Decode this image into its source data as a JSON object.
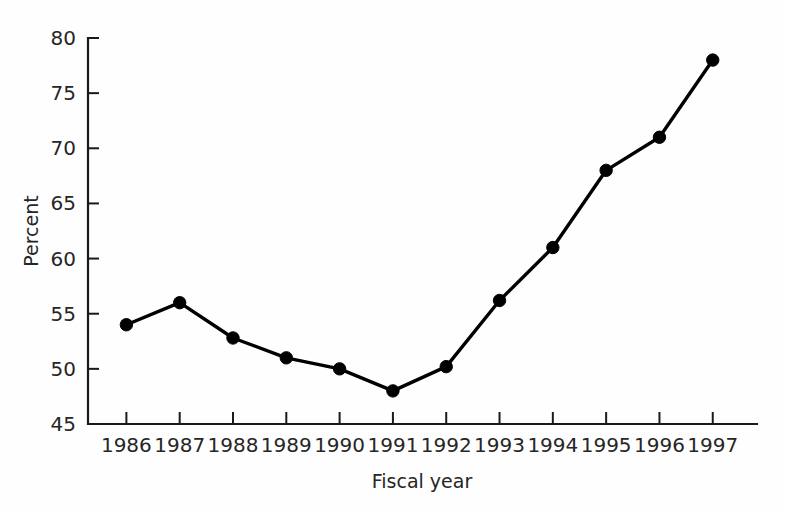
{
  "chart_data": {
    "type": "line",
    "title": "",
    "xlabel": "Fiscal year",
    "ylabel": "Percent",
    "categories": [
      "1986",
      "1987",
      "1988",
      "1989",
      "1990",
      "1991",
      "1992",
      "1993",
      "1994",
      "1995",
      "1996",
      "1997"
    ],
    "values": [
      54,
      56,
      52.8,
      51,
      50,
      48,
      50.2,
      56.2,
      61,
      68,
      71,
      78
    ],
    "series": [
      {
        "name": "Percent",
        "values": [
          54,
          56,
          52.8,
          51,
          50,
          48,
          50.2,
          56.2,
          61,
          68,
          71,
          78
        ]
      }
    ],
    "x": [
      1986,
      1987,
      1988,
      1989,
      1990,
      1991,
      1992,
      1993,
      1994,
      1995,
      1996,
      1997
    ],
    "ylim": [
      45,
      80
    ],
    "xlim": [
      1986,
      1997
    ],
    "y_ticks": [
      45,
      50,
      55,
      60,
      65,
      70,
      75,
      80
    ],
    "y_tick_labels": [
      "45",
      "50",
      "55",
      "60",
      "65",
      "70",
      "75",
      "80"
    ],
    "x_ticks": [
      1986,
      1987,
      1988,
      1989,
      1990,
      1991,
      1992,
      1993,
      1994,
      1995,
      1996,
      1997
    ],
    "x_tick_labels": [
      "1986",
      "1987",
      "1988",
      "1989",
      "1990",
      "1991",
      "1992",
      "1993",
      "1994",
      "1995",
      "1996",
      "1997"
    ],
    "grid": false,
    "legend": null,
    "legend_position": "none",
    "annotations": [],
    "marker": "filled-circle",
    "line_color": "#000000",
    "marker_color": "#000000",
    "background_color": "#fefefe",
    "axis_color": "#1a1a1a"
  }
}
